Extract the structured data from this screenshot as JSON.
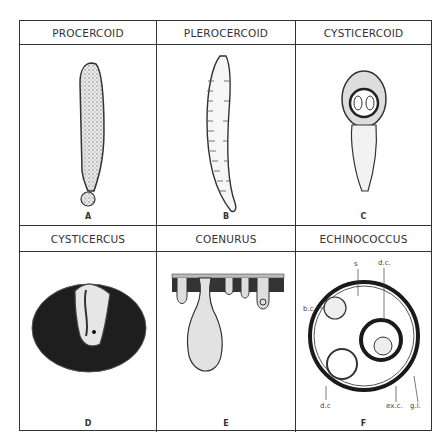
{
  "figure": {
    "panels": [
      {
        "title": "PROCERCOID",
        "letter": "A"
      },
      {
        "title": "PLEROCERCOID",
        "letter": "B"
      },
      {
        "title": "CYSTICERCOID",
        "letter": "C"
      },
      {
        "title": "CYSTICERCUS",
        "letter": "D"
      },
      {
        "title": "COENURUS",
        "letter": "E"
      },
      {
        "title": "ECHINOCOCCUS",
        "letter": "F",
        "annotations": {
          "s": "s",
          "dc_top": "d.c.",
          "bc": "b.c",
          "dc_bottom": "d.c",
          "exc": "ex.c.",
          "gl": "g.l."
        }
      }
    ]
  }
}
